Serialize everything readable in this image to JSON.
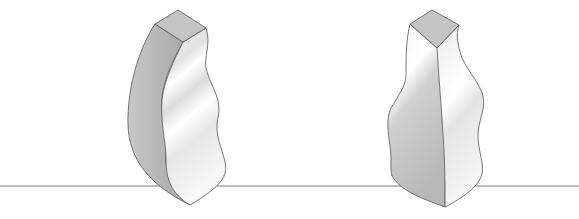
{
  "scene": {
    "description": "Two wavy extruded 3D solids standing on a horizon line",
    "background": "#ffffff",
    "horizon": {
      "y": 186,
      "color": "#b8b8b8"
    },
    "objects": [
      {
        "name": "left-wavy-solid",
        "top_face_color": "#c4c4c4",
        "outline": "#555555"
      },
      {
        "name": "right-wavy-solid",
        "top_face_color": "#c4c4c4",
        "outline": "#555555"
      }
    ]
  }
}
